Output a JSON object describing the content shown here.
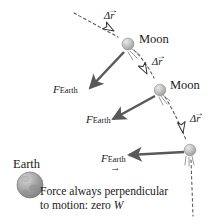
{
  "figure": {
    "background_color": "#ffffff",
    "width": 220,
    "height": 224
  },
  "colors": {
    "force_arrow": "#595959",
    "displacement_arrow_stroke": "#333333",
    "displacement_arrow_fill": "#ffffff",
    "orbit_path": "#555555",
    "moon_body": "#b9b9b9",
    "earth_body": "#9a9a9a",
    "text": "#1a1a1a"
  },
  "bodies": [
    {
      "id": "moon-1",
      "name": "moon-top",
      "label": "Moon",
      "cx": 128,
      "cy": 44,
      "r": 6.0,
      "label_x": 138,
      "label_y": 37
    },
    {
      "id": "moon-2",
      "name": "moon-middle",
      "label": "Moon",
      "cx": 160,
      "cy": 90,
      "r": 5.8,
      "label_x": 169,
      "label_y": 83
    },
    {
      "id": "moon-3",
      "name": "moon-bottom",
      "label": "",
      "cx": 190,
      "cy": 150,
      "r": 5.8,
      "label_x": 0,
      "label_y": 0
    },
    {
      "id": "earth",
      "name": "earth",
      "label": "Earth",
      "cx": 30,
      "cy": 185,
      "r": 13.0,
      "label_x": 14,
      "label_y": 160
    }
  ],
  "displacement_vectors": [
    {
      "id": "dr-1",
      "label": "Δr",
      "label_x": 104,
      "label_y": 16
    },
    {
      "id": "dr-2",
      "label": "Δr",
      "label_x": 152,
      "label_y": 62
    },
    {
      "id": "dr-3",
      "label": "Δr",
      "label_x": 190,
      "label_y": 119
    }
  ],
  "force_vectors": [
    {
      "id": "f-1",
      "main": "F",
      "sub": "Earth",
      "label_x": 53,
      "label_y": 88
    },
    {
      "id": "f-2",
      "main": "F",
      "sub": "Earth",
      "label_x": 86,
      "label_y": 118
    },
    {
      "id": "f-3",
      "main": "F",
      "sub": "Earth",
      "label_x": 101,
      "label_y": 157
    }
  ],
  "caption": {
    "line1": "Force always perpendicular",
    "line2_pre": "to motion: zero ",
    "line2_italic": "W",
    "x": 40,
    "y": 186
  },
  "vector_bar": "→"
}
